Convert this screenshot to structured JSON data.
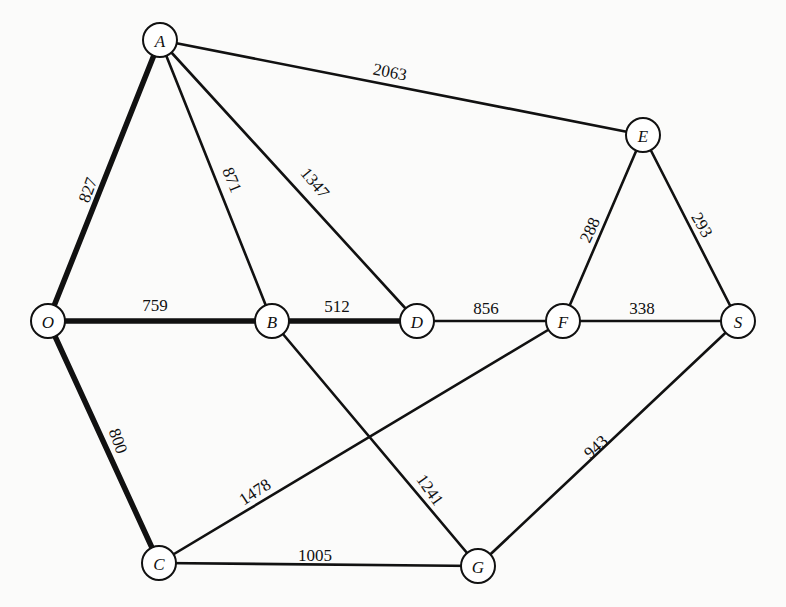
{
  "diagram": {
    "type": "weighted-undirected-graph",
    "nodes": [
      {
        "id": "A",
        "label": "A",
        "x": 160,
        "y": 40
      },
      {
        "id": "E",
        "label": "E",
        "x": 643,
        "y": 135
      },
      {
        "id": "O",
        "label": "O",
        "x": 48,
        "y": 321
      },
      {
        "id": "B",
        "label": "B",
        "x": 272,
        "y": 321
      },
      {
        "id": "D",
        "label": "D",
        "x": 417,
        "y": 321
      },
      {
        "id": "F",
        "label": "F",
        "x": 563,
        "y": 321
      },
      {
        "id": "S",
        "label": "S",
        "x": 738,
        "y": 321
      },
      {
        "id": "C",
        "label": "C",
        "x": 159,
        "y": 563
      },
      {
        "id": "G",
        "label": "G",
        "x": 478,
        "y": 566
      }
    ],
    "edges": [
      {
        "from": "O",
        "to": "A",
        "weight": "827",
        "bold": true,
        "lx": 88,
        "ly": 190,
        "rot": -70
      },
      {
        "from": "A",
        "to": "E",
        "weight": "2063",
        "bold": false,
        "lx": 390,
        "ly": 72,
        "rot": 11
      },
      {
        "from": "A",
        "to": "B",
        "weight": "871",
        "bold": false,
        "lx": 232,
        "ly": 180,
        "rot": 68
      },
      {
        "from": "A",
        "to": "D",
        "weight": "1347",
        "bold": false,
        "lx": 315,
        "ly": 183,
        "rot": 50
      },
      {
        "from": "O",
        "to": "B",
        "weight": "759",
        "bold": true,
        "lx": 155,
        "ly": 305,
        "rot": 0
      },
      {
        "from": "B",
        "to": "D",
        "weight": "512",
        "bold": true,
        "lx": 337,
        "ly": 306,
        "rot": 0
      },
      {
        "from": "D",
        "to": "F",
        "weight": "856",
        "bold": false,
        "lx": 486,
        "ly": 308,
        "rot": 0
      },
      {
        "from": "F",
        "to": "S",
        "weight": "338",
        "bold": false,
        "lx": 642,
        "ly": 308,
        "rot": 0
      },
      {
        "from": "E",
        "to": "F",
        "weight": "288",
        "bold": false,
        "lx": 590,
        "ly": 230,
        "rot": -65
      },
      {
        "from": "E",
        "to": "S",
        "weight": "293",
        "bold": false,
        "lx": 702,
        "ly": 225,
        "rot": 60
      },
      {
        "from": "O",
        "to": "C",
        "weight": "800",
        "bold": true,
        "lx": 118,
        "ly": 441,
        "rot": 70
      },
      {
        "from": "C",
        "to": "F",
        "weight": "1478",
        "bold": false,
        "lx": 255,
        "ly": 492,
        "rot": -33
      },
      {
        "from": "B",
        "to": "G",
        "weight": "1241",
        "bold": false,
        "lx": 430,
        "ly": 490,
        "rot": 55
      },
      {
        "from": "S",
        "to": "G",
        "weight": "943",
        "bold": false,
        "lx": 596,
        "ly": 447,
        "rot": -42
      },
      {
        "from": "C",
        "to": "G",
        "weight": "1005",
        "bold": false,
        "lx": 315,
        "ly": 555,
        "rot": 0
      }
    ],
    "node_radius": 17,
    "colors": {
      "line": "#111111",
      "background": "#fbfbfa",
      "node_fill": "#ffffff"
    }
  }
}
